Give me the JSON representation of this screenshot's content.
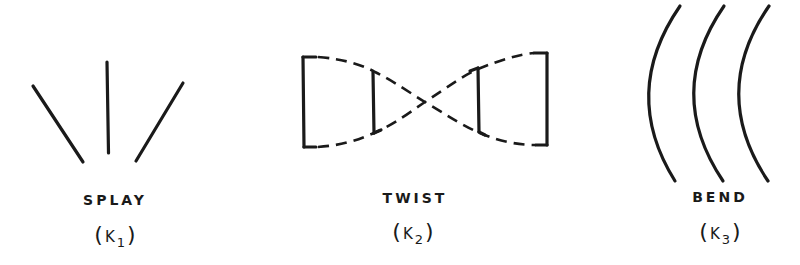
{
  "diagram": {
    "type": "liquid-crystal-deformation-modes",
    "panels": [
      {
        "id": "splay",
        "title": "SPLAY",
        "constant_symbol": "K",
        "constant_index": "1",
        "open_paren": "(",
        "close_paren": ")"
      },
      {
        "id": "twist",
        "title": "TWIST",
        "constant_symbol": "K",
        "constant_index": "2",
        "open_paren": "(",
        "close_paren": ")"
      },
      {
        "id": "bend",
        "title": "BEND",
        "constant_symbol": "K",
        "constant_index": "3",
        "open_paren": "(",
        "close_paren": ")"
      }
    ],
    "colors": {
      "ink": "#1a1a1a",
      "background": "#ffffff"
    }
  }
}
